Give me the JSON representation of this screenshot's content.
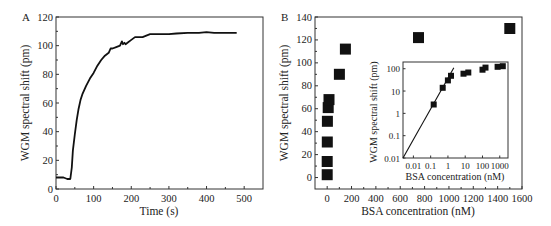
{
  "chart_data": [
    {
      "id": "A",
      "type": "line",
      "panel_label": "A",
      "title": "",
      "xlabel": "Time (s)",
      "ylabel": "WGM spectral shift (pm)",
      "xlim": [
        0,
        550
      ],
      "ylim": [
        0,
        120
      ],
      "xticks": [
        0,
        100,
        200,
        300,
        400,
        500
      ],
      "yticks": [
        0,
        20,
        40,
        60,
        80,
        100,
        120
      ],
      "grid": false,
      "series": [
        {
          "name": "WGM shift",
          "color": "#111111",
          "x": [
            0,
            10,
            20,
            30,
            38,
            42,
            45,
            50,
            55,
            60,
            65,
            70,
            80,
            90,
            100,
            110,
            120,
            130,
            140,
            145,
            150,
            160,
            170,
            175,
            178,
            182,
            185,
            190,
            200,
            210,
            220,
            230,
            240,
            250,
            270,
            300,
            320,
            350,
            380,
            400,
            420,
            450,
            480
          ],
          "y": [
            8,
            8,
            8,
            7,
            7,
            15,
            27,
            38,
            48,
            56,
            62,
            66,
            72,
            77,
            81,
            86,
            90,
            93,
            95,
            98,
            98,
            99,
            100,
            103,
            101,
            102,
            101,
            102,
            104,
            106,
            106,
            106,
            107,
            108,
            108,
            108,
            108.5,
            109,
            109,
            109.5,
            109,
            109,
            109
          ]
        }
      ]
    },
    {
      "id": "B",
      "type": "scatter",
      "panel_label": "B",
      "title": "",
      "xlabel": "BSA concentration (nM)",
      "ylabel": "WGM spectral shift (pm)",
      "xlim": [
        -100,
        1600
      ],
      "ylim": [
        -10,
        140
      ],
      "xticks": [
        0,
        200,
        400,
        600,
        800,
        1000,
        1200,
        1400,
        1600
      ],
      "yticks": [
        0,
        20,
        40,
        60,
        80,
        100,
        120,
        140
      ],
      "grid": false,
      "series": [
        {
          "name": "BSA binding",
          "color": "#111111",
          "marker": "square",
          "x": [
            0.15,
            0.5,
            1,
            1.5,
            8,
            15,
            100,
            150,
            750,
            1500
          ],
          "y": [
            2.5,
            14,
            31,
            49,
            61,
            68,
            90,
            112,
            122,
            130
          ]
        }
      ]
    },
    {
      "id": "B-inset",
      "type": "scatter",
      "title": "",
      "xlabel": "BSA concentration (nM)",
      "ylabel": "WGM spectral shift (pm)",
      "xscale": "log",
      "yscale": "log",
      "xlim": [
        0.0025,
        3000
      ],
      "ylim": [
        0.01,
        200
      ],
      "xticks": [
        0.01,
        0.1,
        1,
        10,
        100,
        1000
      ],
      "xtick_labels": [
        "0.01",
        "0.1",
        "1",
        "10",
        "100",
        "1000"
      ],
      "yticks": [
        0.01,
        0.1,
        1,
        10,
        100
      ],
      "ytick_labels": [
        "0.01",
        "0.1",
        "1",
        "10",
        "100"
      ],
      "grid": false,
      "series": [
        {
          "name": "BSA binding (log)",
          "color": "#111111",
          "marker": "square",
          "x": [
            0.15,
            0.5,
            1,
            1.5,
            8,
            15,
            100,
            150,
            750,
            1500
          ],
          "y": [
            2.5,
            14,
            30,
            48,
            60,
            68,
            90,
            112,
            122,
            130
          ]
        },
        {
          "name": "linear fit",
          "type": "line",
          "color": "#111111",
          "x": [
            0.0025,
            2.2
          ],
          "y": [
            0.01,
            110
          ]
        }
      ]
    }
  ]
}
